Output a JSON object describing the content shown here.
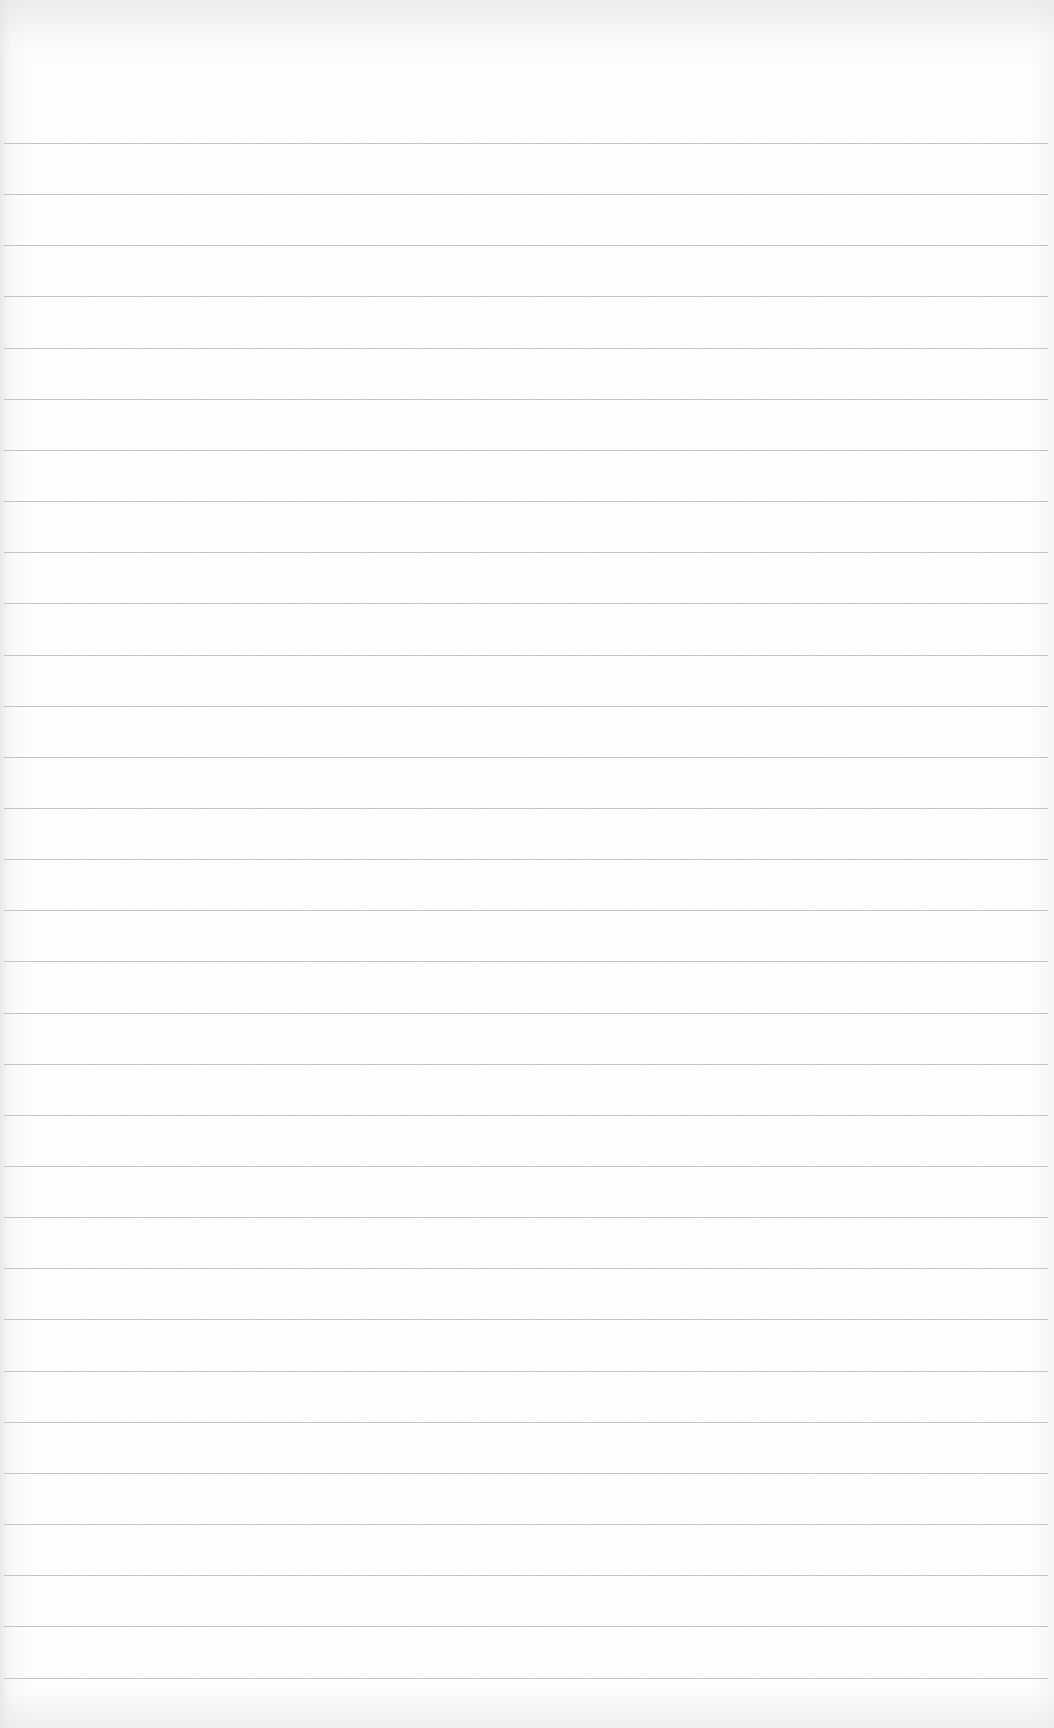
{
  "paper": {
    "type": "ruled-notebook-page",
    "background_color": "#fdfdfd",
    "line_color": "#b8b8b8",
    "first_line_y": 143,
    "line_spacing": 51.15,
    "line_count": 31,
    "content": ""
  }
}
